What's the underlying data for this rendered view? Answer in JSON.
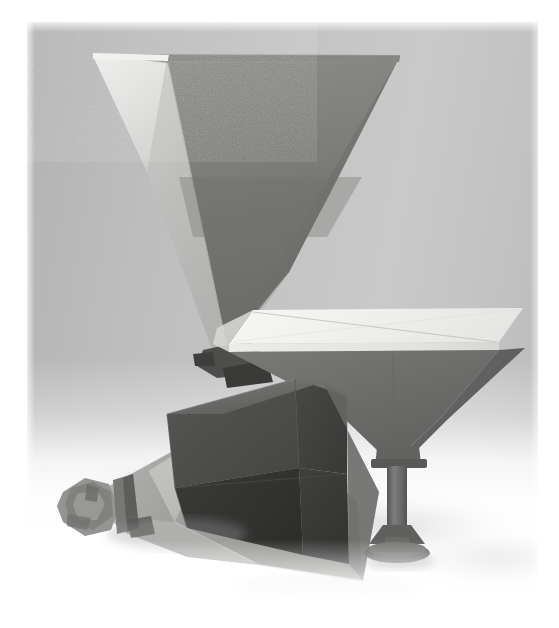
{
  "image": {
    "title": "Three pyramidal horn antennas",
    "medium": "black-and-white photograph",
    "orientation": "portrait",
    "background_description": "seamless light gray studio backdrop curving to a white table surface",
    "alt_text": "Photograph of three metal pyramidal horn antennas of differing sizes arranged on a white table against a gray seamless backdrop"
  },
  "canvas": {
    "width": 559,
    "height": 628,
    "margin_color": "#ffffff",
    "photo": {
      "x": 27,
      "y": 22,
      "width": 511,
      "height": 578
    }
  },
  "palette": {
    "page_white": "#ffffff",
    "backdrop_light": "#c9c9c9",
    "backdrop_mid": "#bcbcbc",
    "backdrop_dark": "#b0b0b0",
    "table_white": "#f7f7f7",
    "highlight_white": "#f2f2f0",
    "metal_bright": "#e8e8e6",
    "metal_light": "#cfcfcd",
    "metal_mid": "#9a9a98",
    "metal_dark": "#6f6f6e",
    "metal_darker": "#575756",
    "interior_dark": "#3b3b3b",
    "interior_darkest": "#2c2c2c",
    "rim_line": "#8a8a88",
    "shadow": "#a9a9a9"
  },
  "subjects": [
    {
      "id": "large-horn",
      "name": "Large pyramidal horn antenna",
      "position": "upper-left, standing upright, aperture facing up",
      "aperture_shape": "rectangular",
      "faces": [
        {
          "name": "left-exterior-panel",
          "tone": "bright",
          "color": "#dededc"
        },
        {
          "name": "inner-back-wall",
          "tone": "mid-dark",
          "color": "#7b7b79"
        },
        {
          "name": "inner-right-wall",
          "tone": "dark",
          "color": "#6b6b69"
        },
        {
          "name": "front-exterior-panel",
          "tone": "light",
          "color": "#b6b6b4"
        }
      ],
      "rim": {
        "name": "aperture-rim",
        "color": "#8d8d8b"
      },
      "throat": {
        "name": "waveguide-throat-flange",
        "color": "#4a4a49"
      }
    },
    {
      "id": "medium-horn",
      "name": "Medium pyramidal horn antenna on pedestal stand",
      "position": "center-right, standing upright on a stand, aperture facing up",
      "aperture_shape": "rectangular",
      "faces": [
        {
          "name": "top-flange-bright-face",
          "tone": "near-white",
          "color": "#f0f0ee"
        },
        {
          "name": "inner-cavity",
          "tone": "dark",
          "color": "#6a6a68"
        },
        {
          "name": "right-outer-face",
          "tone": "mid",
          "color": "#8d8d8b"
        }
      ],
      "stand": {
        "name": "pedestal-stand",
        "parts": [
          "collar",
          "column",
          "flare",
          "base-disc"
        ],
        "color": "#6e6e6d"
      }
    },
    {
      "id": "small-horn",
      "name": "Small pyramidal horn antenna lying on its side",
      "position": "lower-left-center, lying down, square aperture facing the camera",
      "aperture_shape": "square",
      "faces": [
        {
          "name": "aperture-interior-upper-left",
          "tone": "dark",
          "color": "#4a4a48"
        },
        {
          "name": "aperture-interior-lower-left",
          "tone": "darkest",
          "color": "#343433"
        },
        {
          "name": "aperture-interior-right",
          "tone": "dark",
          "color": "#3f3f3e"
        },
        {
          "name": "outer-top-face",
          "tone": "mid-dark",
          "color": "#6d6d6b"
        },
        {
          "name": "outer-bottom-face",
          "tone": "light",
          "color": "#c2c2c0"
        }
      ],
      "connector": {
        "name": "coaxial-feed-connector",
        "description": "crumpled metallic feed at the narrow throat end",
        "color": "#8b8b89"
      }
    }
  ],
  "lighting": {
    "key_light_direction": "upper-left",
    "cast_shadows": [
      "shadow under small horn",
      "shadow under pedestal base",
      "soft shadow to lower right"
    ]
  },
  "annotations": {
    "text_present": false,
    "labels": [],
    "caption": ""
  }
}
